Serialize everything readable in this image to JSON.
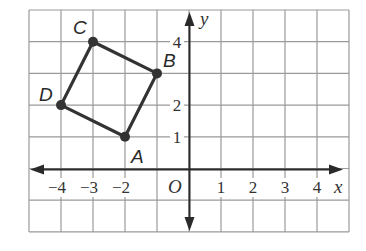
{
  "figure": {
    "type": "coordinate-plane",
    "x_range": [
      -5,
      5
    ],
    "y_range": [
      -2,
      5
    ],
    "axes": {
      "x_label": "x",
      "y_label": "y",
      "origin_label": "O"
    },
    "x_tick_labels": [
      "-4",
      "-3",
      "-2",
      "1",
      "2",
      "3",
      "4"
    ],
    "x_tick_values": [
      -4,
      -3,
      -2,
      1,
      2,
      3,
      4
    ],
    "y_tick_labels": [
      "1",
      "2",
      "4"
    ],
    "y_tick_values": [
      1,
      2,
      4
    ],
    "points": [
      {
        "label": "A",
        "x": -2,
        "y": 1
      },
      {
        "label": "B",
        "x": -1,
        "y": 3
      },
      {
        "label": "C",
        "x": -3,
        "y": 4
      },
      {
        "label": "D",
        "x": -4,
        "y": 2
      }
    ],
    "polygon": [
      "A",
      "B",
      "C",
      "D"
    ],
    "colors": {
      "grid": "#9a9a9a",
      "axis": "#2a2a2a",
      "shape": "#333333"
    }
  }
}
